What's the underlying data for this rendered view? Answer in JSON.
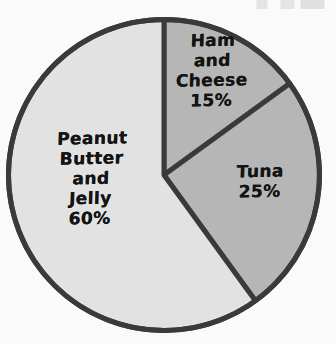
{
  "figure": {
    "background_color": "#fafafa",
    "stroke_color": "#3a3a3a",
    "stroke_width": 5,
    "center_x": 164,
    "center_y": 175,
    "radius": 158,
    "start_angle_deg": 0,
    "direction": "clockwise"
  },
  "chart_data": {
    "type": "pie",
    "title": "",
    "xlabel": "",
    "ylabel": "",
    "legend": "none",
    "grid": false,
    "labels_inside_slices": true,
    "categories": [
      "Ham and Cheese",
      "Tuna",
      "Peanut Butter and Jelly"
    ],
    "values": [
      15,
      25,
      60
    ],
    "value_unit": "%",
    "slices": [
      {
        "name": "ham-and-cheese",
        "label": "Ham\nand\nCheese\n15%",
        "label_name": "Ham and Cheese",
        "value": 15,
        "value_text": "15%",
        "color": "#b6b6b6",
        "start_angle_deg": 0,
        "end_angle_deg": 54
      },
      {
        "name": "tuna",
        "label": "Tuna\n25%",
        "label_name": "Tuna",
        "value": 25,
        "value_text": "25%",
        "color": "#b6b6b6",
        "start_angle_deg": 54,
        "end_angle_deg": 144
      },
      {
        "name": "peanut-butter-and-jelly",
        "label": "Peanut\nButter\nand\nJelly\n60%",
        "label_name": "Peanut Butter and Jelly",
        "value": 60,
        "value_text": "60%",
        "color": "#e2e2e2",
        "start_angle_deg": 144,
        "end_angle_deg": 360
      }
    ]
  }
}
